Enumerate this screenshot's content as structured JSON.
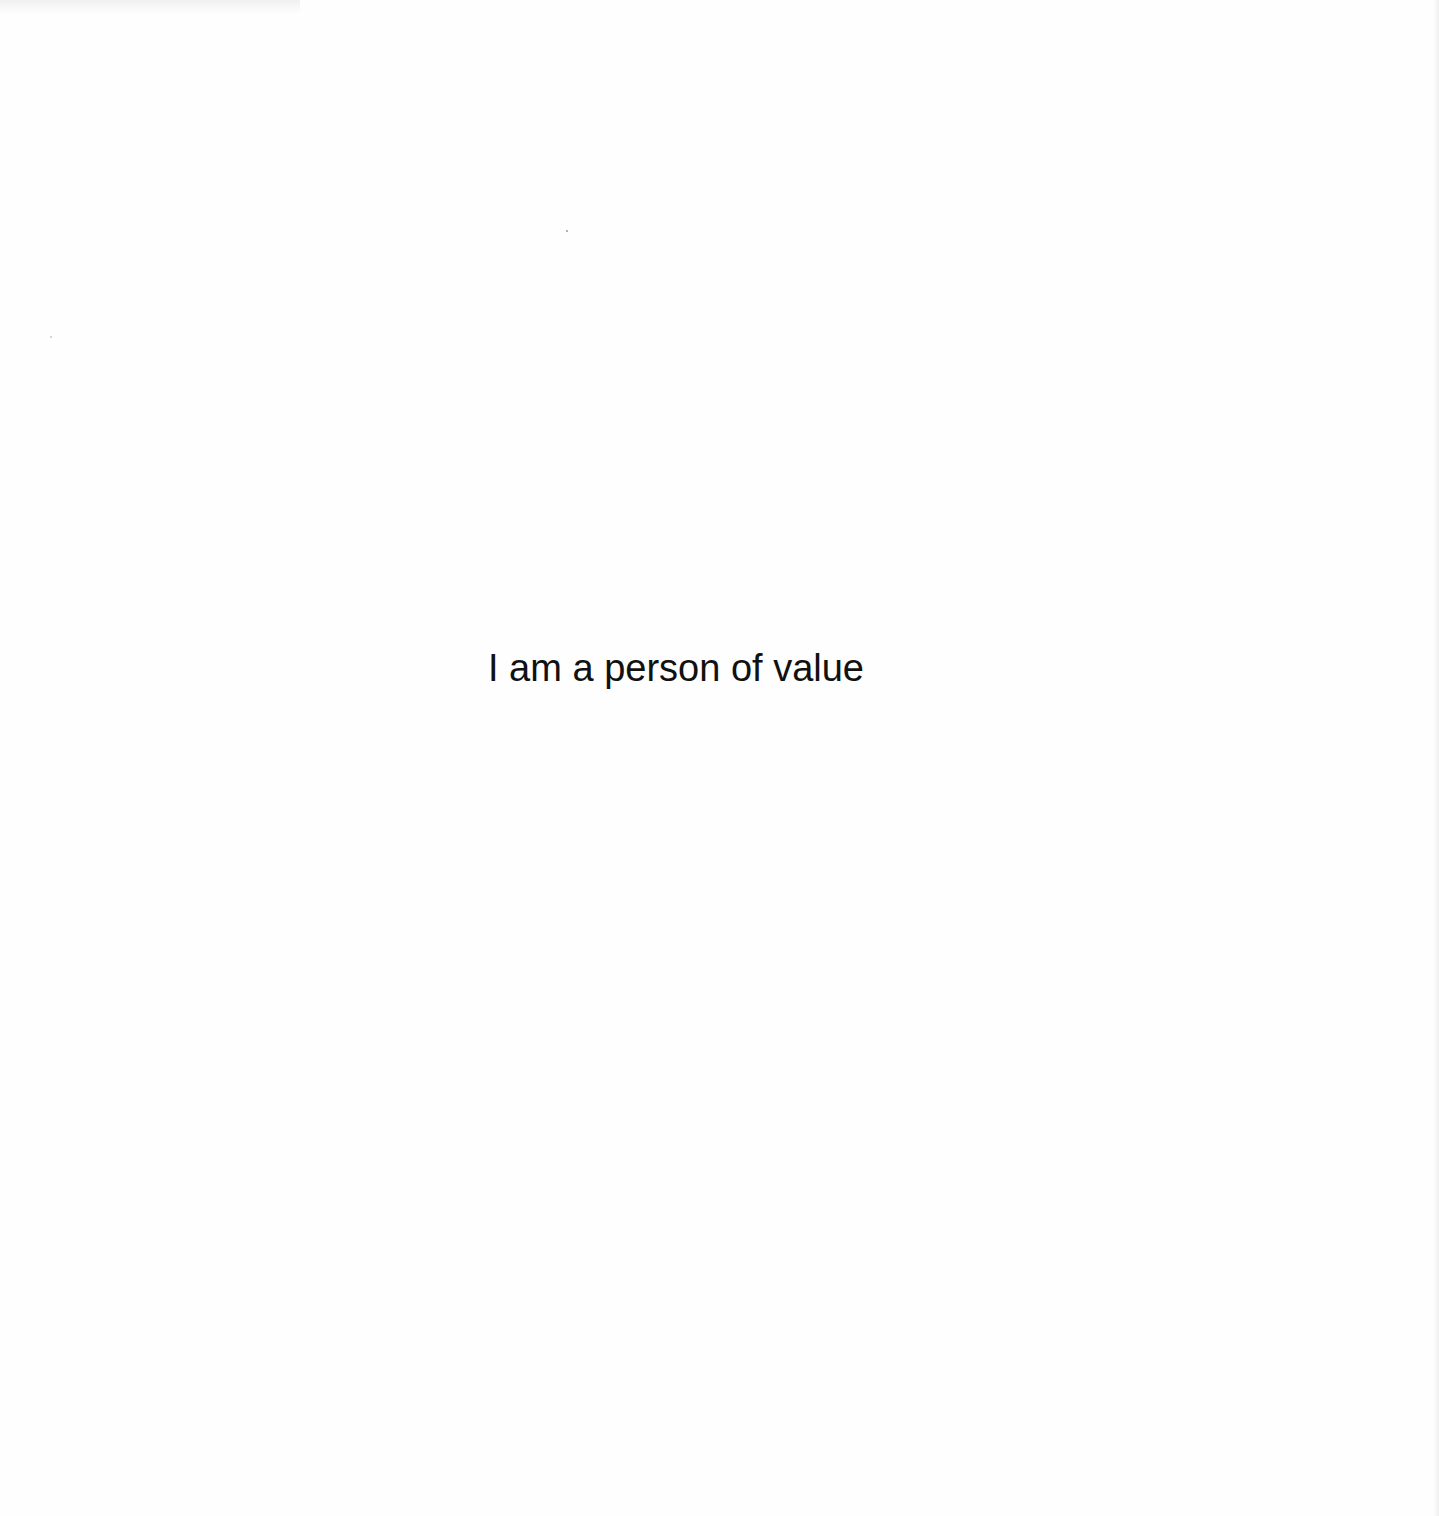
{
  "page": {
    "statement": "I am a person of value",
    "background_color": "#fefefe",
    "text_color": "#111111"
  }
}
